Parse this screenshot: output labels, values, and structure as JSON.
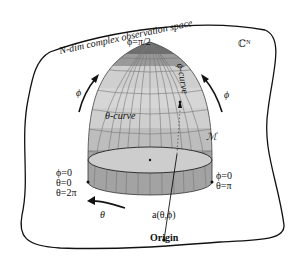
{
  "diagram": {
    "space_label": "N-dim complex observation space",
    "space_symbol": "ℂᴺ",
    "manifold_symbol": "ℳ",
    "top_label": "ϕ=π/2",
    "phi_curve_label": "ϕ-curve",
    "theta_curve_label": "θ-curve",
    "phi_arrow_left": "ϕ",
    "phi_arrow_right": "ϕ",
    "theta_arrow": "θ",
    "left_point": {
      "line1": "ϕ=0",
      "line2": "θ=0",
      "line3": "θ=2π"
    },
    "right_point": {
      "line1": "ϕ=0",
      "line2": "θ=π"
    },
    "vector_label": "a(θ,ϕ)",
    "origin_label": "Origin",
    "colors": {
      "band_top": "#6e6e6e",
      "band_2": "#9a9a9a",
      "band_light": "#cfcfcf",
      "band_mid": "#bdbdbd",
      "band_bottom": "#a3a3a3",
      "inner_ellipse": "#cdcdcd",
      "outline": "#111111",
      "grid": "#7a7a7a"
    }
  }
}
